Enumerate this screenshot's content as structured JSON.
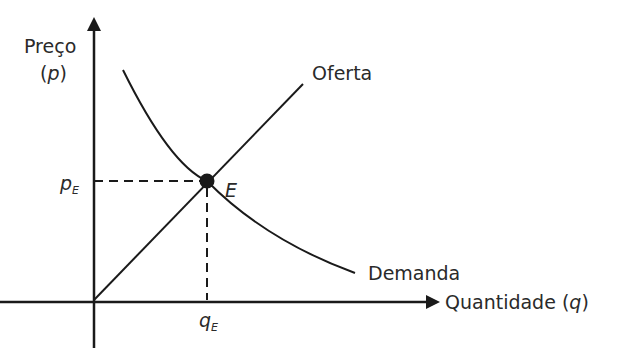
{
  "diagram": {
    "y_axis": {
      "label_line1": "Preço",
      "label_line2": "(p)"
    },
    "x_axis": {
      "label": "Quantidade (q)"
    },
    "curves": [
      {
        "name": "Oferta",
        "shape": "line increasing from origin"
      },
      {
        "name": "Demanda",
        "shape": "convex decreasing curve"
      }
    ],
    "equilibrium": {
      "point_label": "E",
      "price_label": "p",
      "price_sub": "E",
      "quantity_label": "q",
      "quantity_sub": "E"
    },
    "colors": {
      "line": "#1a1a1a",
      "text": "#2a2a2a",
      "background": "#ffffff"
    }
  },
  "labels": {
    "preco": "Preço",
    "p_paren_open": "(",
    "p": "p",
    "p_paren_close": ")",
    "oferta": "Oferta",
    "demanda": "Demanda",
    "quantidade": "Quantidade (",
    "q": "q",
    "q_paren_close": ")",
    "E": "E",
    "pE_main": "p",
    "pE_sub": "E",
    "qE_main": "q",
    "qE_sub": "E"
  }
}
